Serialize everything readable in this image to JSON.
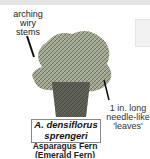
{
  "figure": {
    "annotations": {
      "stems": [
        "arching",
        "wiry stems"
      ],
      "leaves": [
        "1 in. long",
        "needle-like",
        "'leaves'"
      ]
    },
    "scientific_name": [
      "A. densiflorus",
      "sprengeri"
    ],
    "common_name": [
      "Asparagus Fern",
      "(Emerald Fern)"
    ],
    "colors": {
      "foliage": "#6f7a5e",
      "pot": "#3a3a36",
      "box_border": "#888888"
    }
  }
}
